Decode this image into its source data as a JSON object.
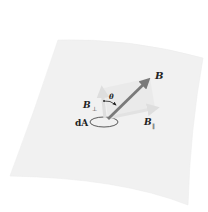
{
  "figure": {
    "surface": "curved surface sheet",
    "labels": {
      "B": "B",
      "B_perp_main": "B",
      "B_perp_sub": "⊥",
      "B_par_main": "B",
      "B_par_sub": "∥",
      "theta": "θ",
      "dA": "dA"
    },
    "colors": {
      "surface": "#f1f1f1",
      "vector_B": "#7a7a7a",
      "component_vectors": "#e2e2e2",
      "plane_shading": "#ebebeb",
      "outline": "#333333",
      "text": "#222222"
    }
  }
}
